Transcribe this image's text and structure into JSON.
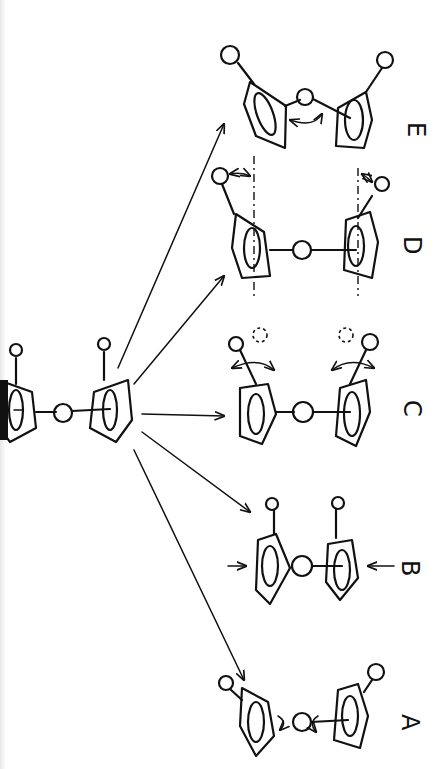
{
  "diagram": {
    "title": "",
    "orientation": "rotated 90° (landscape figure shown portrait)",
    "source_structure": {
      "name": "parent-sandwich",
      "description": "bent metallocene-like sandwich with two substituted five-membered rings and central atom"
    },
    "variants": [
      {
        "id": "A",
        "label": "A",
        "description": "ring rotation about centroid-metal axis (curved arrows)"
      },
      {
        "id": "B",
        "label": "B",
        "description": "ring compression / approach (straight arrows toward rings)"
      },
      {
        "id": "C",
        "label": "C",
        "description": "substituent rotation (dashed alternate positions, curved arrows)"
      },
      {
        "id": "D",
        "label": "D",
        "description": "substituent tilt out of plane (dash-dot reference lines, small arrows)"
      },
      {
        "id": "E",
        "label": "E",
        "description": "ring bending / tilt (double-headed arrow between rings)"
      }
    ],
    "colors": {
      "ink": "#111111",
      "paper": "#ffffff"
    }
  }
}
